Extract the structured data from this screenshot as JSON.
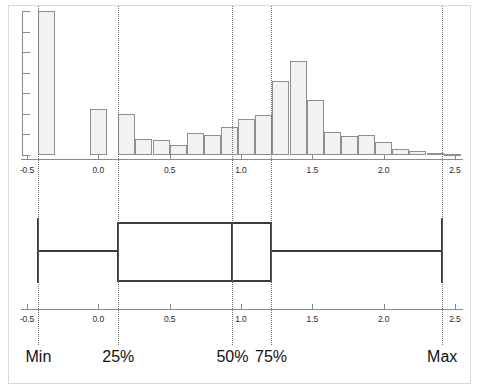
{
  "figure": {
    "type": "histogram-with-boxplot",
    "background": "#ffffff",
    "frame_color": "#d9d9d9",
    "bar_fill": "#f2f2f2",
    "bar_stroke": "#8f8f8f",
    "axis_color": "#8a8a8a",
    "guide_color": "#6f6f6f",
    "box_color": "#3b3b3b"
  },
  "axis": {
    "ticks": [
      {
        "label": "-0.5",
        "value": -0.5
      },
      {
        "label": "0.0",
        "value": 0.0
      },
      {
        "label": "0.5",
        "value": 0.5
      },
      {
        "label": "1.0",
        "value": 1.0
      },
      {
        "label": "1.5",
        "value": 1.5
      },
      {
        "label": "2.0",
        "value": 2.0
      },
      {
        "label": "2.5",
        "value": 2.5
      }
    ],
    "xmin": -0.5,
    "xmax": 2.5,
    "y_tick_count": 8
  },
  "quantiles": [
    {
      "key": "min",
      "label": "Min",
      "value": -0.42
    },
    {
      "key": "q1",
      "label": "25%",
      "value": 0.14
    },
    {
      "key": "med",
      "label": "50%",
      "value": 0.94
    },
    {
      "key": "q3",
      "label": "75%",
      "value": 1.21
    },
    {
      "key": "max",
      "label": "Max",
      "value": 2.41
    }
  ],
  "chart_data": {
    "type": "bar",
    "title": "",
    "xlabel": "",
    "ylabel": "",
    "xlim": [
      -0.5,
      2.5
    ],
    "ylim": [
      0,
      8
    ],
    "grid": false,
    "legend": "none",
    "bin_width": 0.06,
    "categories": [
      "-0.42",
      "-0.36",
      "-0.30",
      "-0.24",
      "-0.18",
      "-0.12",
      "-0.06",
      "0.00",
      "0.06",
      "0.12",
      "0.18",
      "0.24",
      "0.30",
      "0.36",
      "0.42",
      "0.48",
      "0.54",
      "0.60",
      "0.66",
      "0.72",
      "0.78",
      "0.84",
      "0.90",
      "0.96",
      "1.02",
      "1.08",
      "1.14",
      "1.20",
      "1.26",
      "1.32",
      "1.38",
      "1.44",
      "1.50",
      "1.56",
      "1.62",
      "1.68",
      "1.74",
      "1.80",
      "1.86",
      "1.92",
      "1.98",
      "2.04",
      "2.10",
      "2.16",
      "2.22",
      "2.28",
      "2.34",
      "2.40"
    ],
    "values": [
      8.0,
      0.0,
      0.0,
      0.0,
      2.55,
      0.0,
      2.3,
      0.9,
      0.85,
      0.55,
      1.25,
      1.1,
      1.55,
      2.0,
      2.25,
      4.1,
      5.25,
      3.05,
      1.3,
      1.05,
      1.1,
      0.75,
      0.35,
      0.22,
      0.1,
      0.06,
      0.06,
      0.06,
      0.04,
      0.0,
      0.0,
      0.0,
      0.0,
      0.0,
      0.0,
      0.0,
      0.0,
      0.0,
      0.0,
      0.0,
      0.0,
      0.0,
      0.0,
      0.0,
      0.0,
      0.0,
      0.0,
      0.0
    ],
    "bars": [
      {
        "x": -0.42,
        "h": 8.0
      },
      {
        "x": -0.06,
        "h": 2.55
      },
      {
        "x": 0.14,
        "h": 2.3
      },
      {
        "x": 0.26,
        "h": 0.9
      },
      {
        "x": 0.38,
        "h": 0.85
      },
      {
        "x": 0.5,
        "h": 0.55
      },
      {
        "x": 0.62,
        "h": 1.25
      },
      {
        "x": 0.74,
        "h": 1.1
      },
      {
        "x": 0.86,
        "h": 1.55
      },
      {
        "x": 0.98,
        "h": 2.0
      },
      {
        "x": 1.1,
        "h": 2.25
      },
      {
        "x": 1.22,
        "h": 4.1
      },
      {
        "x": 1.34,
        "h": 5.25
      },
      {
        "x": 1.46,
        "h": 3.05
      },
      {
        "x": 1.58,
        "h": 1.3
      },
      {
        "x": 1.7,
        "h": 1.05
      },
      {
        "x": 1.82,
        "h": 1.1
      },
      {
        "x": 1.94,
        "h": 0.75
      },
      {
        "x": 2.06,
        "h": 0.35
      },
      {
        "x": 2.18,
        "h": 0.22
      },
      {
        "x": 2.3,
        "h": 0.1
      },
      {
        "x": 2.42,
        "h": 0.06
      }
    ]
  },
  "boxplot": {
    "type": "box",
    "min": -0.42,
    "q1": 0.14,
    "median": 0.94,
    "q3": 1.21,
    "max": 2.41,
    "orientation": "horizontal"
  }
}
